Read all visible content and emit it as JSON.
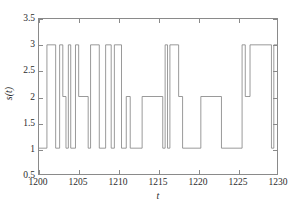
{
  "chart_data": {
    "type": "line",
    "title": "",
    "subtitle": "",
    "xlabel": "t",
    "ylabel": "s(t)",
    "xlim": [
      1200,
      1230
    ],
    "ylim": [
      0.5,
      3.5
    ],
    "xticks": [
      1200,
      1205,
      1210,
      1215,
      1220,
      1225,
      1230
    ],
    "xtick_labels": [
      "1200",
      "1205",
      "1210",
      "1215",
      "1220",
      "1225",
      "1230"
    ],
    "yticks": [
      0.5,
      1,
      1.5,
      2,
      2.5,
      3,
      3.5
    ],
    "ytick_labels": [
      "0.5",
      "1",
      "1.5",
      "2",
      "2.5",
      "3",
      "3.5"
    ],
    "grid": false,
    "legend": null,
    "line_color": "#808080",
    "line_width": 0.8,
    "interpolation": "step-post",
    "series": [
      {
        "name": "s(t)",
        "x": [
          1200.0,
          1201.0,
          1201.0,
          1202.1,
          1202.1,
          1202.6,
          1202.6,
          1203.0,
          1203.0,
          1203.4,
          1203.4,
          1203.7,
          1203.7,
          1204.0,
          1204.0,
          1204.6,
          1204.6,
          1205.0,
          1205.0,
          1206.2,
          1206.2,
          1206.5,
          1206.5,
          1207.6,
          1207.6,
          1208.4,
          1208.4,
          1209.1,
          1209.1,
          1209.5,
          1209.5,
          1210.4,
          1210.4,
          1211.0,
          1211.0,
          1211.5,
          1211.5,
          1213.0,
          1213.0,
          1215.6,
          1215.6,
          1215.9,
          1215.9,
          1216.2,
          1216.2,
          1216.5,
          1216.5,
          1217.6,
          1217.6,
          1218.1,
          1218.1,
          1220.4,
          1220.4,
          1223.0,
          1223.0,
          1225.6,
          1225.6,
          1226.0,
          1226.0,
          1226.6,
          1226.6,
          1229.3,
          1229.3,
          1229.6,
          1229.6,
          1230.0
        ],
        "y": [
          1,
          1,
          3,
          3,
          1,
          1,
          3,
          3,
          2,
          2,
          1,
          1,
          3,
          3,
          1,
          1,
          3,
          3,
          2,
          2,
          1,
          1,
          3,
          3,
          1,
          1,
          3,
          3,
          1,
          1,
          3,
          3,
          1,
          1,
          2,
          2,
          1,
          1,
          2,
          2,
          1,
          1,
          3,
          3,
          1,
          1,
          3,
          3,
          2,
          2,
          1,
          1,
          2,
          2,
          1,
          1,
          3,
          3,
          2,
          2,
          3,
          3,
          1,
          1,
          3,
          3
        ],
        "description": "Discrete three-state step signal alternating between levels 1, 2 and 3"
      }
    ]
  },
  "axes": {
    "box_color": "#8a8a8a",
    "tick_color": "#8a8a8a",
    "label_color": "#2b2b2b"
  }
}
